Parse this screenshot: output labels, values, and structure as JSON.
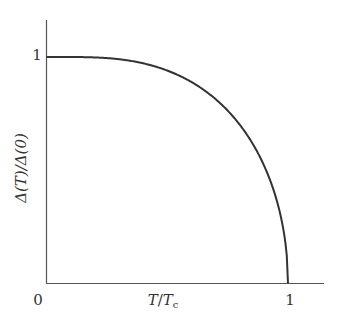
{
  "chart_data": {
    "type": "line",
    "title": "",
    "xlabel": "T/Tc",
    "ylabel": "Δ(T)/Δ(0)",
    "x_ticks": [
      "0",
      "1"
    ],
    "y_ticks": [
      "1"
    ],
    "xlim": [
      0,
      1.13
    ],
    "ylim": [
      0,
      1.1
    ],
    "grid": false,
    "legend": null,
    "series": [
      {
        "name": "Δ(T)/Δ(0)",
        "x": [
          0.0,
          0.1,
          0.2,
          0.3,
          0.4,
          0.5,
          0.6,
          0.7,
          0.8,
          0.85,
          0.9,
          0.95,
          0.98,
          1.0
        ],
        "y": [
          1.0,
          1.0,
          1.0,
          0.998,
          0.985,
          0.95,
          0.89,
          0.81,
          0.68,
          0.6,
          0.49,
          0.33,
          0.18,
          0.0
        ]
      }
    ]
  },
  "labels": {
    "y_tick_1": "1",
    "x_tick_0": "0",
    "x_tick_1": "1",
    "x_axis_label_T": "T",
    "x_axis_label_slash": "/",
    "x_axis_label_Tc": "T",
    "x_axis_label_sub": "c",
    "y_axis_label": "Δ(T)/Δ(0)"
  },
  "colors": {
    "axis": "#555555",
    "curve": "#333333"
  }
}
